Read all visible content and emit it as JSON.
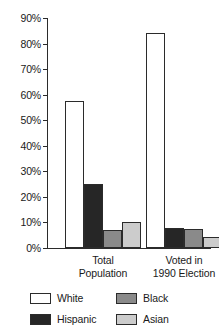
{
  "chart_data": {
    "type": "bar",
    "title": "",
    "subtitle": "",
    "xlabel": "",
    "ylabel": "",
    "categories": [
      "Total Population",
      "Voted in 1990 Election"
    ],
    "series": [
      {
        "name": "White",
        "color": "#ffffff",
        "values": [
          57.5,
          84.0
        ]
      },
      {
        "name": "Hispanic",
        "color": "#262626",
        "values": [
          25.0,
          8.0
        ]
      },
      {
        "name": "Black",
        "color": "#8a8a8a",
        "values": [
          7.0,
          7.5
        ]
      },
      {
        "name": "Asian",
        "color": "#cccccc",
        "values": [
          10.0,
          4.5
        ]
      }
    ],
    "ylim": [
      0,
      90
    ],
    "ytick_values": [
      0,
      10,
      20,
      30,
      40,
      50,
      60,
      70,
      80,
      90
    ],
    "ytick_labels": [
      "0%",
      "10%",
      "20%",
      "30%",
      "40%",
      "50%",
      "60%",
      "70%",
      "80%",
      "90%"
    ],
    "grid": false,
    "legend_position": "bottom",
    "legend_order": [
      "White",
      "Black",
      "Hispanic",
      "Asian"
    ],
    "axis_color": "#2b2b2b",
    "bar_outline_color": "#2b2b2b",
    "background_color": "#ffffff"
  },
  "group_labels": [
    {
      "line1": "Total",
      "line2": "Population"
    },
    {
      "line1": "Voted in",
      "line2": "1990 Election"
    }
  ],
  "legend": {
    "items": [
      {
        "label": "White",
        "swatch": "fill-white"
      },
      {
        "label": "Black",
        "swatch": "fill-black"
      },
      {
        "label": "Hispanic",
        "swatch": "fill-hispanic"
      },
      {
        "label": "Asian",
        "swatch": "fill-asian"
      }
    ]
  }
}
